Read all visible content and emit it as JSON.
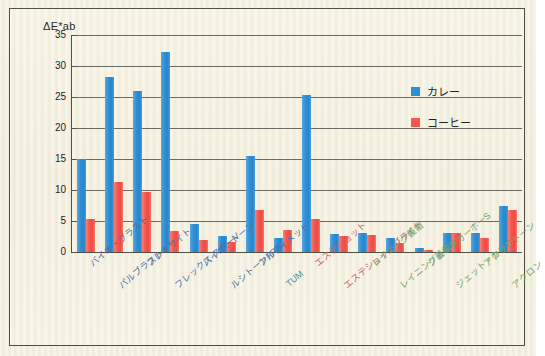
{
  "chart_data": {
    "type": "bar",
    "title": "",
    "ylabel": "ΔE*ab",
    "xlabel": "",
    "ylim": [
      0,
      35
    ],
    "yticks": [
      0,
      5,
      10,
      15,
      20,
      25,
      30,
      35
    ],
    "grid": true,
    "legend_position": "top-right",
    "categories": [
      "バイオ・ブラスト",
      "パルブラスト",
      "フレキサイト",
      "フレックス スターV",
      "バイオ：トーン",
      "ルシトーンFRS",
      "アルティメット",
      "TUM",
      "エステショット",
      "エステショットブライト",
      "レイニング義歯",
      "レイニング義歯N",
      "ジェットカーボーS",
      "ジェット・カーボ",
      "アクリ：トーン",
      "アクロン"
    ],
    "series": [
      {
        "name": "カレー",
        "color": "#2f8fd6",
        "values": [
          15.0,
          28.3,
          26.0,
          32.3,
          4.5,
          2.6,
          15.5,
          2.3,
          25.3,
          2.9,
          3.0,
          2.2,
          0.6,
          3.0,
          3.1,
          7.4
        ]
      },
      {
        "name": "コーヒー",
        "color": "#f4564e",
        "values": [
          5.4,
          11.3,
          9.6,
          3.4,
          1.9,
          1.6,
          6.8,
          3.6,
          5.3,
          2.6,
          2.7,
          1.4,
          0.3,
          3.1,
          2.2,
          6.7
        ]
      }
    ]
  },
  "legend": {
    "items": [
      {
        "label": "カレー",
        "color": "#2f8fd6"
      },
      {
        "label": "コーヒー",
        "color": "#f4564e"
      }
    ]
  },
  "axis": {
    "y_title": "ΔE*ab",
    "ytick_labels": [
      "35",
      "30",
      "25",
      "20",
      "15",
      "10",
      "5",
      "0"
    ]
  },
  "xlabel_colors": [
    "#4a6fa5",
    "#4a6fa5",
    "#4a6fa5",
    "#4a6fa5",
    "#4a6fa5",
    "#4a6fa5",
    "#4a6fa5",
    "#3f8f9a",
    "#c4646b",
    "#c4646b",
    "#6fa36b",
    "#6fa36b",
    "#6fa36b",
    "#6fa36b",
    "#6fa36b",
    "#6fa36b"
  ]
}
